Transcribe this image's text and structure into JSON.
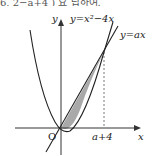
{
  "header_fragment": "6, 2−a+4 ) 요 답하여.",
  "diagram": {
    "type": "function-graph",
    "curves": [
      {
        "name": "parabola",
        "label": "y=x²−4x"
      },
      {
        "name": "line",
        "label": "y=ax"
      }
    ],
    "axes": {
      "x_label": "x",
      "y_label": "y",
      "origin_label": "O"
    },
    "marked_x": "a+4",
    "shaded_region": "between y=ax and y=x²−4x from 0 to a+4",
    "colors": {
      "shade": "#a9a9a9",
      "stroke": "#222222",
      "dashed": "#555555"
    }
  }
}
